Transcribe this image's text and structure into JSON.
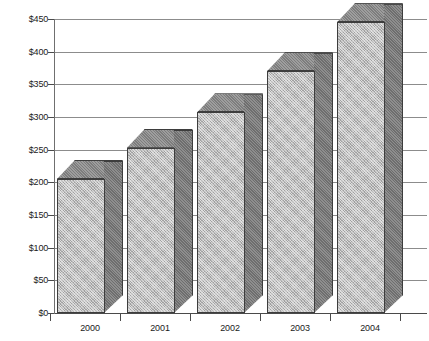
{
  "chart_data": {
    "type": "bar",
    "title": "",
    "subtitle": "",
    "xlabel": "",
    "ylabel": "",
    "categories": [
      "2000",
      "2001",
      "2002",
      "2003",
      "2004"
    ],
    "values": [
      205,
      253,
      307,
      370,
      445
    ],
    "series": [
      {
        "name": "",
        "values": [
          205,
          253,
          307,
          370,
          445
        ]
      }
    ],
    "ylim": [
      0,
      450
    ],
    "ytick_values": [
      0,
      50,
      100,
      150,
      200,
      250,
      300,
      350,
      400,
      450
    ],
    "ytick_labels": [
      "$0",
      "$50",
      "$100",
      "$150",
      "$200",
      "$250",
      "$300",
      "$350",
      "$400",
      "$450"
    ],
    "grid": true,
    "grid_axis": "y",
    "legend": false,
    "legend_position": "none",
    "annotations": [],
    "style": {
      "three_d": true,
      "bar_front_color": "#bcbcbc",
      "bar_side_color": "#6e6e6e",
      "bar_top_color": "#7d7d7d",
      "bar_edge_color": "#3d3d3d",
      "gridline_color": "#8c8c8c",
      "axis_color": "#4a4a4a",
      "text_color": "#1a1a1a",
      "background_color": "#ffffff"
    }
  }
}
